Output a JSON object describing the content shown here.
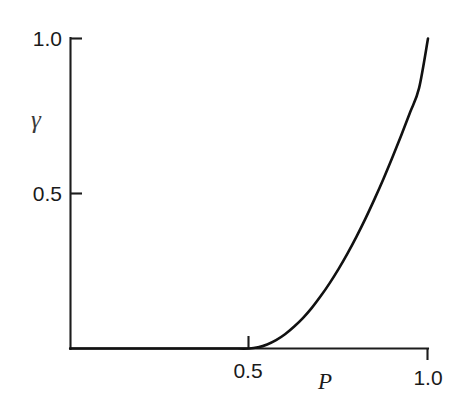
{
  "figure": {
    "background_color": "#ffffff",
    "ink_color": "#1a1a1a"
  },
  "chart_data": {
    "type": "line",
    "title": "",
    "subtitle": "",
    "xlabel": "P",
    "ylabel": "γ",
    "xlim": [
      0.0,
      1.0
    ],
    "ylim": [
      0.0,
      1.0
    ],
    "grid": false,
    "legend": null,
    "legend_position": "none",
    "x_ticks": [
      {
        "value": 0.5,
        "label": "0.5",
        "direction": "inward-up"
      },
      {
        "value": 1.0,
        "label": "1.0",
        "direction": "outward-down"
      }
    ],
    "y_ticks": [
      {
        "value": 0.5,
        "label": "0.5",
        "direction": "inward-right"
      },
      {
        "value": 1.0,
        "label": "1.0",
        "direction": "inward-right"
      }
    ],
    "annotations": [],
    "series": [
      {
        "name": "order-parameter",
        "description": "gamma is zero below the threshold P = 0.5, then rises with upward curvature to 1.0 at P = 1.0",
        "threshold": 0.5,
        "x": [
          0.0,
          0.05,
          0.1,
          0.15,
          0.2,
          0.25,
          0.3,
          0.35,
          0.4,
          0.45,
          0.5,
          0.525,
          0.55,
          0.575,
          0.6,
          0.625,
          0.65,
          0.675,
          0.7,
          0.725,
          0.75,
          0.775,
          0.8,
          0.825,
          0.85,
          0.875,
          0.9,
          0.925,
          0.95,
          0.975,
          1.0
        ],
        "y": [
          0.0,
          0.0,
          0.0,
          0.0,
          0.0,
          0.0,
          0.0,
          0.0,
          0.0,
          0.0,
          0.0,
          0.004,
          0.013,
          0.027,
          0.046,
          0.07,
          0.098,
          0.131,
          0.169,
          0.211,
          0.257,
          0.307,
          0.361,
          0.419,
          0.481,
          0.546,
          0.615,
          0.687,
          0.762,
          0.84,
          1.0
        ]
      }
    ]
  },
  "axis_labels": {
    "y_top": "1.0",
    "y_mid": "0.5",
    "x_mid": "0.5",
    "x_right": "1.0",
    "y_title": "γ",
    "x_title": "P"
  }
}
